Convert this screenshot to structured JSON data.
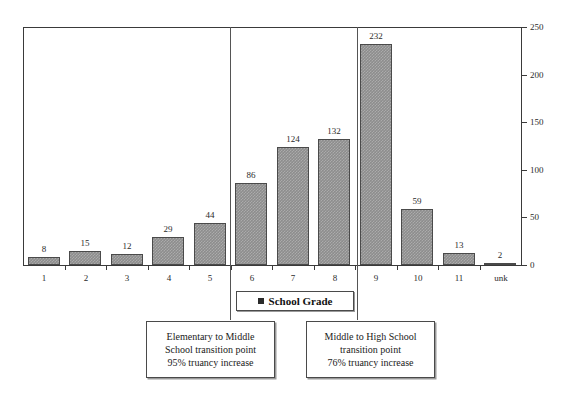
{
  "chart_data": {
    "type": "bar",
    "title": "",
    "xlabel": "School Grade",
    "ylabel": "",
    "categories": [
      "1",
      "2",
      "3",
      "4",
      "5",
      "6",
      "7",
      "8",
      "9",
      "10",
      "11",
      "unk"
    ],
    "values": [
      8,
      15,
      12,
      29,
      44,
      86,
      124,
      132,
      232,
      59,
      13,
      2
    ],
    "series": [
      {
        "name": "School Grade",
        "values": [
          8,
          15,
          12,
          29,
          44,
          86,
          124,
          132,
          232,
          59,
          13,
          2
        ]
      }
    ],
    "ylim": [
      0,
      250
    ],
    "yticks": [
      0,
      50,
      100,
      150,
      200,
      250
    ],
    "ytick_labels": [
      "0",
      "50",
      "100",
      "150",
      "200",
      "250"
    ],
    "y_axis_position": "right",
    "grid": false,
    "legend_position": "below-axis-center",
    "bar_color": "#8d8d8d",
    "bar_border_color": "#4a4a4a",
    "axis_color": "#3a3a3a",
    "data_labels_shown": true,
    "annotations": [
      {
        "id": "elementary-to-middle",
        "after_category": "5",
        "lines": [
          "Elementary to Middle",
          "School transition point",
          "95% truancy increase"
        ]
      },
      {
        "id": "middle-to-high",
        "after_category": "8",
        "lines": [
          "Middle to High School",
          "transition point",
          "76% truancy increase"
        ]
      }
    ]
  },
  "legend": {
    "swatch_color": "#2b2b2b",
    "label": "School Grade"
  }
}
